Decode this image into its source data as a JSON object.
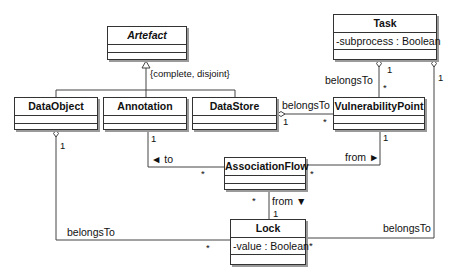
{
  "diagram": {
    "type": "UML class diagram",
    "constraint": "{complete, disjoint}",
    "classes": {
      "artefact": {
        "name": "Artefact",
        "abstract": true
      },
      "dataobject": {
        "name": "DataObject"
      },
      "annotation": {
        "name": "Annotation"
      },
      "datastore": {
        "name": "DataStore"
      },
      "task": {
        "name": "Task",
        "attributes": [
          "-subprocess : Boolean"
        ]
      },
      "vulnerabilitypoint": {
        "name": "VulnerabilityPoint"
      },
      "associationflow": {
        "name": "AssociationFlow"
      },
      "lock": {
        "name": "Lock",
        "attributes": [
          "-value : Boolean"
        ]
      }
    },
    "associations": {
      "datastore_vp": {
        "label": "belongsTo",
        "m1": "1",
        "m2": "*"
      },
      "task_vp": {
        "label": "belongsTo",
        "m1": "1",
        "m2": "*"
      },
      "annotation_af": {
        "label": "◄ to",
        "m1": "1",
        "m2": "*"
      },
      "vp_af": {
        "label": "from ►",
        "m1": "1",
        "m2": "*"
      },
      "af_lock": {
        "label": "from ▼",
        "m1": "1",
        "m2": "*"
      },
      "dataobject_lock": {
        "label": "belongsTo",
        "m1": "1",
        "m2": "*"
      },
      "task_lock": {
        "label": "belongsTo",
        "m1": "1",
        "m2": "*"
      }
    }
  }
}
